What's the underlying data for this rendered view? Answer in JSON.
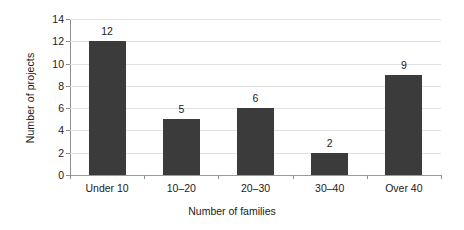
{
  "chart_data": {
    "type": "bar",
    "title": "",
    "subtitle": "",
    "categories": [
      "Under 10",
      "10–20",
      "20–30",
      "30–40",
      "Over 40"
    ],
    "values": [
      12,
      5,
      6,
      2,
      9
    ],
    "data_labels": [
      "12",
      "5",
      "6",
      "2",
      "9"
    ],
    "xlabel": "Number of families",
    "ylabel": "Number of projects",
    "ylim": [
      0,
      14
    ],
    "ytick_labels": [
      "0",
      "2",
      "4",
      "6",
      "8",
      "10",
      "12",
      "14"
    ],
    "ytick_values": [
      0,
      2,
      4,
      6,
      8,
      10,
      12,
      14
    ],
    "grid": "horizontal",
    "legend": "none",
    "series": [
      {
        "name": "Number of projects",
        "values": [
          12,
          5,
          6,
          2,
          9
        ]
      }
    ],
    "colors": {
      "bar_fill": "#3b3b3b",
      "gridline": "#e2e2e2",
      "axis_line": "#8f8f8f",
      "background": "#ffffff",
      "text": "#1a1a1a"
    }
  }
}
